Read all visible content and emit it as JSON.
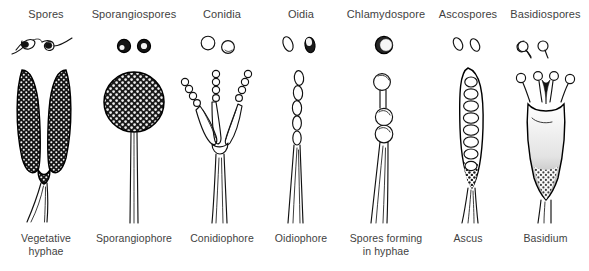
{
  "figure": {
    "background_color": "#ffffff",
    "ink_color": "#111111",
    "text_color": "#3f3f3f",
    "column_count": 7,
    "row_labels": {
      "top_row": "spore forms",
      "bottom_row": "spore-bearing structures"
    }
  },
  "columns": [
    {
      "id": "spores",
      "spore_label": "Spores",
      "structure_label": "Vegetative\nhyphae",
      "structure_label_line1": "Vegetative",
      "structure_label_line2": "hyphae",
      "spore_icon": "hyphal-fragments-icon",
      "structure_icon": "vegetative-hyphae-icon",
      "spore_count": 2,
      "structure_description": "Forked Y-shaped dark stippled hyphae",
      "left": 0,
      "width": 92
    },
    {
      "id": "sporangiospores",
      "spore_label": "Sporangiospores",
      "structure_label": "Sporangiophore",
      "structure_label_line1": "Sporangiophore",
      "structure_label_line2": "",
      "spore_icon": "round-spore-pair-icon",
      "structure_icon": "sporangiophore-icon",
      "spore_count": 2,
      "structure_description": "Stippled spherical sporangium on a long slender stalk",
      "left": 88,
      "width": 92
    },
    {
      "id": "conidia",
      "spore_label": "Conidia",
      "structure_label": "Conidiophore",
      "structure_label_line1": "Conidiophore",
      "structure_label_line2": "",
      "spore_icon": "round-conidia-pair-icon",
      "structure_icon": "conidiophore-icon",
      "spore_count": 2,
      "structure_description": "Branched phialides bearing chains of conidia",
      "left": 176,
      "width": 92
    },
    {
      "id": "oidia",
      "spore_label": "Oidia",
      "structure_label": "Oidiophore",
      "structure_label_line1": "Oidiophore",
      "structure_label_line2": "",
      "spore_icon": "oval-oidia-pair-icon",
      "structure_icon": "oidiophore-icon",
      "spore_count": 2,
      "structure_description": "Slender hypha fragmenting into a chain of oidia",
      "left": 258,
      "width": 86
    },
    {
      "id": "chlamydospore",
      "spore_label": "Chlamydospore",
      "structure_label": "Spores forming\nin hyphae",
      "structure_label_line1": "Spores forming",
      "structure_label_line2": "in hyphae",
      "spore_icon": "thick-walled-spore-icon",
      "structure_icon": "chlamydospore-hypha-icon",
      "spore_count": 1,
      "structure_description": "Hypha with terminal and intercalary thick-walled chlamydospores",
      "left": 338,
      "width": 96
    },
    {
      "id": "ascospores",
      "spore_label": "Ascospores",
      "structure_label": "Ascus",
      "structure_label_line1": "Ascus",
      "structure_label_line2": "",
      "spore_icon": "oval-ascospore-pair-icon",
      "structure_icon": "ascus-icon",
      "spore_count": 2,
      "structure_description": "Elongated sac containing a row of eight ascospores",
      "left": 428,
      "width": 80
    },
    {
      "id": "basidiospores",
      "spore_label": "Basidiospores",
      "structure_label": "Basidium",
      "structure_label_line1": "Basidium",
      "structure_label_line2": "",
      "spore_icon": "teardrop-basidiospore-pair-icon",
      "structure_icon": "basidium-icon",
      "spore_count": 2,
      "structure_description": "Club-shaped cell with four sterigmata bearing basidiospores",
      "left": 502,
      "width": 87
    }
  ]
}
